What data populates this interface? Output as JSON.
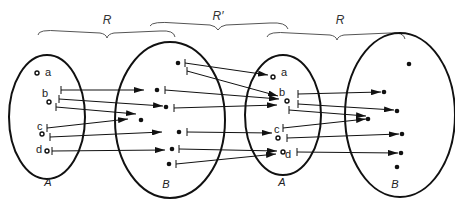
{
  "diagram": {
    "relations": [
      {
        "id": "R1",
        "label": "R",
        "x": 107,
        "y": 24
      },
      {
        "id": "Rp",
        "label": "R′",
        "x": 218,
        "y": 20
      },
      {
        "id": "R2",
        "label": "R",
        "x": 340,
        "y": 24
      }
    ],
    "sets": [
      {
        "id": "A1",
        "label": "A",
        "x": 48,
        "y": 186
      },
      {
        "id": "B1",
        "label": "B",
        "x": 166,
        "y": 188
      },
      {
        "id": "A2",
        "label": "A",
        "x": 282,
        "y": 186
      },
      {
        "id": "B2",
        "label": "B",
        "x": 395,
        "y": 188
      }
    ],
    "elements_A": [
      "a",
      "b",
      "c",
      "d"
    ],
    "colors": {
      "stroke": "#111111",
      "brace": "#555555",
      "background": "#ffffff"
    }
  }
}
